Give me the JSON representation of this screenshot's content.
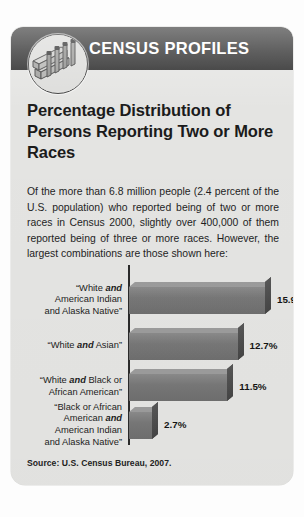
{
  "header": {
    "title": "CENSUS PROFILES",
    "logo_icon": "census-medallion-icon",
    "bar_color": "#2e2e2e"
  },
  "headline": "Percentage Distribution of Persons Reporting Two or More Races",
  "body_text": "Of the more than 6.8 million people (2.4 percent of the U.S. population) who reported being of two or more races in Census 2000, slightly over 400,000 of them reported being of three or more races. However, the largest combinations are those shown here:",
  "source": "Source: U.S. Census Bureau, 2007.",
  "chart_data": {
    "type": "bar",
    "orientation": "horizontal",
    "title": "Percentage Distribution of Persons Reporting Two or More Races",
    "xlabel": "",
    "ylabel": "",
    "xlim": [
      0,
      15.9
    ],
    "grid": false,
    "legend": false,
    "bar_color": "#7a7a7a",
    "categories": [
      "“White and American Indian and Alaska Native”",
      "“White and Asian”",
      "“White and Black or African American”",
      "“Black or African American and American Indian and Alaska Native”"
    ],
    "values": [
      15.9,
      12.7,
      11.5,
      2.7
    ],
    "value_labels": [
      "15.9%",
      "12.7%",
      "11.5%",
      "2.7%"
    ],
    "rows": [
      {
        "label_lines": [
          [
            {
              "t": "“White ",
              "b": false
            },
            {
              "t": "and",
              "b": true
            }
          ],
          [
            {
              "t": "American Indian",
              "b": false
            }
          ],
          [
            {
              "t": "and Alaska Native”",
              "b": false
            }
          ]
        ],
        "value": 15.9,
        "value_label": "15.9%"
      },
      {
        "label_lines": [
          [
            {
              "t": "“White ",
              "b": false
            },
            {
              "t": "and",
              "b": true
            },
            {
              "t": " Asian”",
              "b": false
            }
          ]
        ],
        "value": 12.7,
        "value_label": "12.7%"
      },
      {
        "label_lines": [
          [
            {
              "t": "“White ",
              "b": false
            },
            {
              "t": "and",
              "b": true
            },
            {
              "t": " Black or",
              "b": false
            }
          ],
          [
            {
              "t": "African American”",
              "b": false
            }
          ]
        ],
        "value": 11.5,
        "value_label": "11.5%"
      },
      {
        "label_lines": [
          [
            {
              "t": "“Black or African",
              "b": false
            }
          ],
          [
            {
              "t": "American ",
              "b": false
            },
            {
              "t": "and",
              "b": true
            }
          ],
          [
            {
              "t": "American Indian",
              "b": false
            }
          ],
          [
            {
              "t": "and Alaska Native”",
              "b": false
            }
          ]
        ],
        "value": 2.7,
        "value_label": "2.7%"
      }
    ]
  }
}
